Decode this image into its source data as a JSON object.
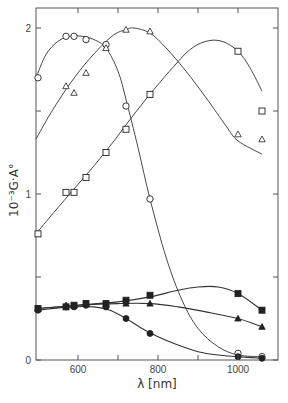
{
  "chart_data": {
    "type": "scatter",
    "title": "",
    "xlabel": "λ [nm]",
    "ylabel": "10⁻³G·A°",
    "xlim": [
      495,
      1100
    ],
    "ylim": [
      0,
      2.2
    ],
    "x_ticks": [
      600,
      700,
      800,
      900,
      1000
    ],
    "x_tick_labels": [
      "600",
      "",
      "800",
      "",
      "1000"
    ],
    "y_ticks": [
      0,
      0.5,
      1,
      1.5,
      2
    ],
    "y_tick_labels": [
      "0",
      "",
      "1",
      "",
      "2"
    ],
    "grid": false,
    "legend": "none",
    "series": [
      {
        "name": "open-circle",
        "marker": "circle",
        "filled": false,
        "x": [
          500,
          570,
          590,
          620,
          670,
          720,
          780,
          1000,
          1060
        ],
        "y": [
          1.7,
          1.95,
          1.95,
          1.93,
          1.9,
          1.53,
          0.97,
          0.04,
          0.02
        ],
        "curve_x": [
          495,
          520,
          550,
          580,
          610,
          640,
          670,
          700,
          720,
          750,
          780,
          820,
          860,
          900,
          950,
          1000,
          1060
        ],
        "curve_y": [
          1.7,
          1.84,
          1.92,
          1.95,
          1.95,
          1.93,
          1.88,
          1.74,
          1.57,
          1.28,
          0.97,
          0.62,
          0.36,
          0.19,
          0.08,
          0.03,
          0.02
        ]
      },
      {
        "name": "open-triangle",
        "marker": "triangle",
        "filled": false,
        "x": [
          570,
          590,
          620,
          670,
          720,
          780,
          1000,
          1060
        ],
        "y": [
          1.65,
          1.61,
          1.73,
          1.88,
          1.99,
          1.98,
          1.36,
          1.33
        ],
        "curve_x": [
          495,
          530,
          570,
          610,
          650,
          690,
          720,
          740,
          780,
          820,
          870,
          920,
          970,
          1000,
          1060
        ],
        "curve_y": [
          1.33,
          1.48,
          1.63,
          1.76,
          1.87,
          1.96,
          1.99,
          2.0,
          1.97,
          1.88,
          1.74,
          1.58,
          1.41,
          1.32,
          1.24
        ]
      },
      {
        "name": "open-square",
        "marker": "square",
        "filled": false,
        "x": [
          500,
          570,
          590,
          620,
          670,
          720,
          780,
          1000,
          1060
        ],
        "y": [
          0.76,
          1.01,
          1.01,
          1.1,
          1.25,
          1.39,
          1.6,
          1.86,
          1.5
        ],
        "curve_x": [
          495,
          540,
          590,
          640,
          690,
          740,
          790,
          840,
          880,
          920,
          960,
          1000,
          1030,
          1060
        ],
        "curve_y": [
          0.76,
          0.89,
          1.03,
          1.17,
          1.32,
          1.48,
          1.63,
          1.77,
          1.87,
          1.92,
          1.92,
          1.86,
          1.76,
          1.62
        ]
      },
      {
        "name": "filled-square",
        "marker": "square",
        "filled": true,
        "x": [
          500,
          570,
          590,
          620,
          670,
          720,
          780,
          1000,
          1060
        ],
        "y": [
          0.31,
          0.32,
          0.33,
          0.34,
          0.34,
          0.36,
          0.39,
          0.4,
          0.3
        ],
        "curve_x": [
          500,
          600,
          700,
          780,
          850,
          900,
          950,
          1000,
          1060
        ],
        "curve_y": [
          0.31,
          0.33,
          0.35,
          0.38,
          0.42,
          0.44,
          0.44,
          0.4,
          0.3
        ]
      },
      {
        "name": "filled-triangle",
        "marker": "triangle",
        "filled": true,
        "x": [
          500,
          570,
          590,
          620,
          670,
          720,
          780,
          1000,
          1060
        ],
        "y": [
          0.31,
          0.33,
          0.33,
          0.34,
          0.33,
          0.34,
          0.34,
          0.25,
          0.2
        ],
        "curve_x": [
          500,
          600,
          700,
          780,
          850,
          920,
          1000,
          1060
        ],
        "curve_y": [
          0.31,
          0.33,
          0.34,
          0.34,
          0.32,
          0.29,
          0.25,
          0.2
        ]
      },
      {
        "name": "filled-circle",
        "marker": "circle",
        "filled": true,
        "x": [
          500,
          570,
          590,
          620,
          670,
          720,
          780,
          1000,
          1060
        ],
        "y": [
          0.3,
          0.32,
          0.32,
          0.33,
          0.32,
          0.25,
          0.16,
          0.02,
          0.01
        ],
        "curve_x": [
          500,
          580,
          640,
          680,
          720,
          760,
          800,
          850,
          900,
          950,
          1000,
          1060
        ],
        "curve_y": [
          0.3,
          0.32,
          0.32,
          0.3,
          0.25,
          0.19,
          0.14,
          0.09,
          0.05,
          0.03,
          0.02,
          0.01
        ]
      }
    ]
  }
}
